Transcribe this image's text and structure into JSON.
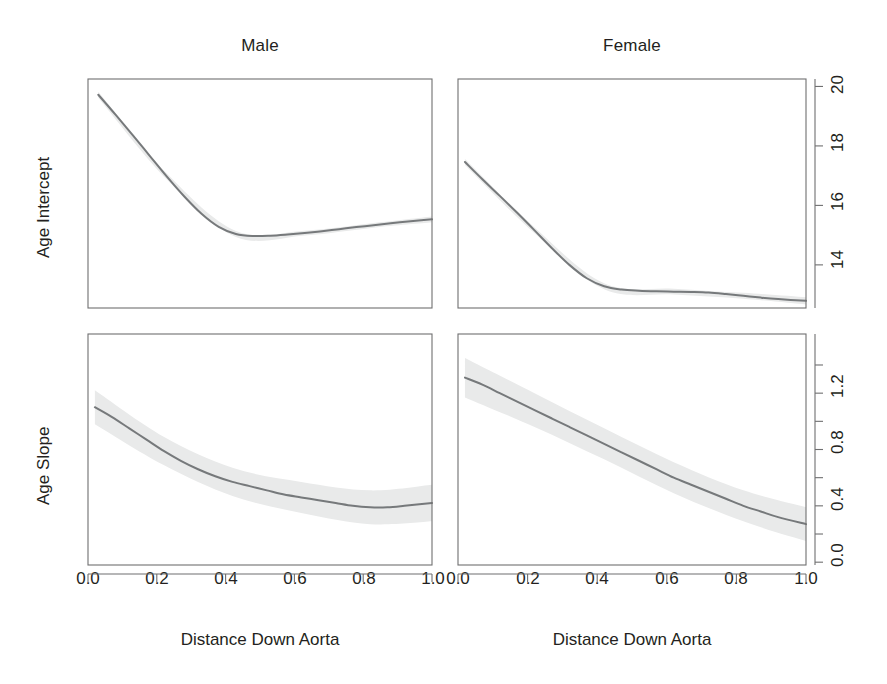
{
  "figure": {
    "background_color": "#ffffff",
    "line_color": "#76797b",
    "band_color": "#e9eaea",
    "frame_color": "#6f6f70",
    "text_color": "#231f20"
  },
  "panels": {
    "top_left_title": "Male",
    "top_right_title": "Female",
    "y_label_top": "Age Intercept",
    "y_label_bottom": "Age Slope",
    "x_label_left": "Distance Down Aorta",
    "x_label_right": "Distance Down Aorta"
  },
  "x_ticks": [
    "0.0",
    "0.2",
    "0.4",
    "0.6",
    "0.8",
    "1.0"
  ],
  "y_ticks_top": [
    "20",
    "18",
    "16",
    "14"
  ],
  "y_ticks_bottom": [
    "1.2",
    "0.8",
    "0.4",
    "0.0"
  ],
  "chart_data": {
    "type": "line",
    "title": "",
    "layout": {
      "rows": 2,
      "cols": 2,
      "row_labels": [
        "Age Intercept",
        "Age Slope"
      ],
      "col_labels": [
        "Male",
        "Female"
      ],
      "grid": false,
      "legend": "none",
      "y_axis_position": "right",
      "shaded_band": "pointwise confidence interval"
    },
    "xlabel": "Distance Down Aorta",
    "xlim": [
      0.0,
      1.0
    ],
    "xticks": [
      0.0,
      0.2,
      0.4,
      0.6,
      0.8,
      1.0
    ],
    "subplots": [
      {
        "row": 0,
        "col": 0,
        "panel_title": "Male",
        "ylabel": "Age Intercept",
        "ylim": [
          12.55,
          20.25
        ],
        "yticks": [
          14,
          16,
          18,
          20
        ],
        "series": [
          {
            "name": "Age Intercept (Male) fit",
            "x": [
              0.03,
              0.08,
              0.13,
              0.18,
              0.23,
              0.28,
              0.33,
              0.38,
              0.43,
              0.48,
              0.53,
              0.58,
              0.63,
              0.68,
              0.73,
              0.78,
              0.83,
              0.88,
              0.93,
              1.0
            ],
            "y": [
              19.72,
              19.05,
              18.36,
              17.66,
              16.96,
              16.3,
              15.72,
              15.28,
              15.04,
              14.97,
              14.98,
              15.02,
              15.07,
              15.13,
              15.2,
              15.27,
              15.33,
              15.4,
              15.46,
              15.53
            ]
          },
          {
            "name": "Age Intercept (Male) upper CI",
            "x": [
              0.03,
              0.23,
              0.43,
              0.63,
              0.83,
              1.0
            ],
            "y": [
              19.82,
              17.06,
              15.14,
              15.15,
              15.41,
              15.63
            ]
          },
          {
            "name": "Age Intercept (Male) lower CI",
            "x": [
              0.03,
              0.23,
              0.43,
              0.63,
              0.83,
              1.0
            ],
            "y": [
              19.62,
              16.86,
              14.94,
              14.99,
              15.25,
              15.43
            ]
          }
        ]
      },
      {
        "row": 0,
        "col": 1,
        "panel_title": "Female",
        "ylabel": "Age Intercept",
        "ylim": [
          12.55,
          20.25
        ],
        "yticks": [
          14,
          16,
          18,
          20
        ],
        "series": [
          {
            "name": "Age Intercept (Female) fit",
            "x": [
              0.02,
              0.07,
              0.12,
              0.17,
              0.22,
              0.27,
              0.32,
              0.37,
              0.42,
              0.47,
              0.52,
              0.57,
              0.62,
              0.67,
              0.72,
              0.77,
              0.82,
              0.87,
              0.92,
              1.0
            ],
            "y": [
              17.46,
              16.88,
              16.32,
              15.75,
              15.16,
              14.56,
              14.0,
              13.55,
              13.28,
              13.17,
              13.13,
              13.11,
              13.1,
              13.09,
              13.07,
              13.02,
              12.96,
              12.9,
              12.85,
              12.79
            ]
          },
          {
            "name": "Age Intercept (Female) upper CI",
            "x": [
              0.02,
              0.22,
              0.42,
              0.62,
              0.82,
              1.0
            ],
            "y": [
              17.56,
              15.26,
              13.38,
              13.2,
              13.06,
              12.91
            ]
          },
          {
            "name": "Age Intercept (Female) lower CI",
            "x": [
              0.02,
              0.22,
              0.42,
              0.62,
              0.82,
              1.0
            ],
            "y": [
              17.36,
              15.06,
              13.18,
              13.0,
              12.86,
              12.67
            ]
          }
        ]
      },
      {
        "row": 1,
        "col": 0,
        "panel_title": "Male",
        "ylabel": "Age Slope",
        "ylim": [
          -0.22,
          1.42
        ],
        "yticks": [
          0.0,
          0.4,
          0.8,
          1.2
        ],
        "series": [
          {
            "name": "Age Slope (Male) fit",
            "x": [
              0.02,
              0.07,
              0.12,
              0.17,
              0.22,
              0.27,
              0.32,
              0.37,
              0.42,
              0.47,
              0.52,
              0.57,
              0.62,
              0.67,
              0.72,
              0.77,
              0.82,
              0.87,
              0.92,
              1.0
            ],
            "y": [
              0.9,
              0.83,
              0.75,
              0.67,
              0.59,
              0.52,
              0.46,
              0.41,
              0.37,
              0.34,
              0.31,
              0.28,
              0.26,
              0.24,
              0.22,
              0.2,
              0.19,
              0.19,
              0.2,
              0.22
            ]
          },
          {
            "name": "Age Slope (Male) upper CI",
            "x": [
              0.02,
              0.22,
              0.42,
              0.62,
              0.82,
              1.0
            ],
            "y": [
              1.02,
              0.69,
              0.47,
              0.37,
              0.31,
              0.35
            ]
          },
          {
            "name": "Age Slope (Male) lower CI",
            "x": [
              0.02,
              0.22,
              0.42,
              0.62,
              0.82,
              1.0
            ],
            "y": [
              0.78,
              0.49,
              0.27,
              0.15,
              0.07,
              0.09
            ]
          }
        ]
      },
      {
        "row": 1,
        "col": 1,
        "panel_title": "Female",
        "ylabel": "Age Slope",
        "ylim": [
          -0.22,
          1.42
        ],
        "yticks": [
          0.0,
          0.4,
          0.8,
          1.2
        ],
        "series": [
          {
            "name": "Age Slope (Female) fit",
            "x": [
              0.02,
              0.07,
              0.12,
              0.17,
              0.22,
              0.27,
              0.32,
              0.37,
              0.42,
              0.47,
              0.52,
              0.57,
              0.62,
              0.67,
              0.72,
              0.77,
              0.82,
              0.87,
              0.92,
              1.0
            ],
            "y": [
              1.11,
              1.06,
              1.0,
              0.94,
              0.88,
              0.82,
              0.76,
              0.7,
              0.64,
              0.58,
              0.52,
              0.46,
              0.4,
              0.35,
              0.3,
              0.25,
              0.2,
              0.16,
              0.12,
              0.07
            ]
          },
          {
            "name": "Age Slope (Female) upper CI",
            "x": [
              0.02,
              0.22,
              0.42,
              0.62,
              0.82,
              1.0
            ],
            "y": [
              1.25,
              1.0,
              0.75,
              0.51,
              0.31,
              0.19
            ]
          },
          {
            "name": "Age Slope (Female) lower CI",
            "x": [
              0.02,
              0.22,
              0.42,
              0.62,
              0.82,
              1.0
            ],
            "y": [
              0.97,
              0.76,
              0.53,
              0.29,
              0.09,
              -0.05
            ]
          }
        ]
      }
    ]
  }
}
